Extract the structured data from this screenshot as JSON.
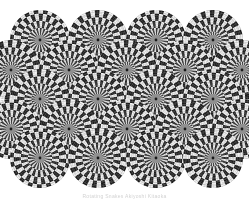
{
  "image": {
    "title": "Rotating Snakes",
    "kind": "peripheral-drift-optical-illusion",
    "width": 249,
    "height": 200,
    "background_color": "#ffffff"
  },
  "caption": {
    "text": "Rotating Snakes  Akiyoshi Kitaoka",
    "color": "#d2d2d2",
    "visible": true
  },
  "palette": {
    "background": "#ffffff",
    "disc_field": "#9a9a9a",
    "dark_band": "#1c1c1c",
    "light_band": "#f2f2f2",
    "mid_gray": "#8a8a8a",
    "center_dot": "#1a1a1a",
    "hub_gray": "#909090"
  },
  "pattern": {
    "type": "spiral-disc-grid",
    "grid_layout": "hexagonal-offset",
    "disc_radius": 30,
    "hub_radius": 5,
    "center_dot_radius": 1.4,
    "rings": 7,
    "segments_per_ring": 38,
    "ring_twist_degrees": 4.2,
    "alternate_ring_phase": true,
    "disc_count": 22,
    "discs": [
      {
        "cx": 40,
        "cy": 40,
        "spin": 1
      },
      {
        "cx": 98,
        "cy": 40,
        "spin": -1
      },
      {
        "cx": 156,
        "cy": 40,
        "spin": 1
      },
      {
        "cx": 213,
        "cy": 40,
        "spin": -1
      },
      {
        "cx": 11,
        "cy": 70,
        "spin": -1
      },
      {
        "cx": 69,
        "cy": 70,
        "spin": 1
      },
      {
        "cx": 127,
        "cy": 70,
        "spin": -1
      },
      {
        "cx": 185,
        "cy": 70,
        "spin": 1
      },
      {
        "cx": 242,
        "cy": 70,
        "spin": -1
      },
      {
        "cx": 40,
        "cy": 99,
        "spin": -1
      },
      {
        "cx": 98,
        "cy": 99,
        "spin": 1
      },
      {
        "cx": 156,
        "cy": 99,
        "spin": -1
      },
      {
        "cx": 213,
        "cy": 99,
        "spin": 1
      },
      {
        "cx": 11,
        "cy": 129,
        "spin": 1
      },
      {
        "cx": 69,
        "cy": 129,
        "spin": -1
      },
      {
        "cx": 127,
        "cy": 129,
        "spin": 1
      },
      {
        "cx": 185,
        "cy": 129,
        "spin": -1
      },
      {
        "cx": 242,
        "cy": 129,
        "spin": 1
      },
      {
        "cx": 40,
        "cy": 158,
        "spin": 1
      },
      {
        "cx": 98,
        "cy": 158,
        "spin": -1
      },
      {
        "cx": 156,
        "cy": 158,
        "spin": 1
      },
      {
        "cx": 213,
        "cy": 158,
        "spin": -1
      }
    ]
  }
}
